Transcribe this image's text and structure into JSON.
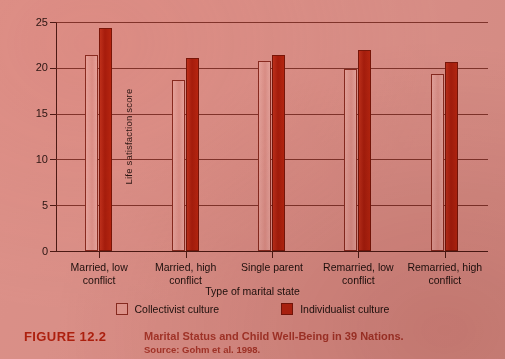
{
  "chart_data": {
    "type": "bar",
    "title": "Marital Status and Child Well-Being in 39 Nations.",
    "xlabel": "Type of marital state",
    "ylabel": "Life satisfaction score",
    "ylim": [
      0,
      25
    ],
    "yticks": [
      0,
      5,
      10,
      15,
      20,
      25
    ],
    "grid": true,
    "legend_position": "bottom",
    "categories": [
      "Married, low\nconflict",
      "Married, high\nconflict",
      "Single parent",
      "Remarried, low\nconflict",
      "Remarried, high\nconflict"
    ],
    "series": [
      {
        "name": "Collectivist culture",
        "color": "#e3988f",
        "values": [
          21.4,
          18.7,
          20.8,
          19.9,
          19.3
        ]
      },
      {
        "name": "Individualist culture",
        "color": "#b52410",
        "values": [
          24.4,
          21.1,
          21.4,
          22.0,
          20.6
        ]
      }
    ]
  },
  "caption": {
    "figure_number": "FIGURE 12.2",
    "title": "Marital Status and Child Well-Being in 39 Nations.",
    "source": "Source: Gohm et al. 1998."
  },
  "colors": {
    "page_background": "#dd9189",
    "collectivist": "#e3988f",
    "individualist": "#b52410",
    "axis": "#4d1a14",
    "gridline": "#73251c",
    "caption_accent": "#b0200e",
    "caption_text": "#a8362a"
  }
}
